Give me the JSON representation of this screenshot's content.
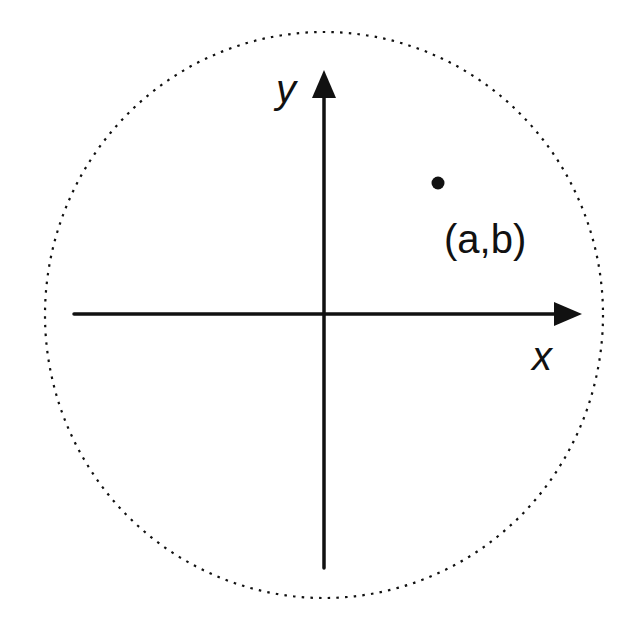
{
  "diagram": {
    "title": "",
    "colors": {
      "background": "#ffffff",
      "ink": "#111111"
    },
    "circle": {
      "cx": 324,
      "cy": 315,
      "rx": 279,
      "ry": 283,
      "style": "dotted"
    },
    "axes": {
      "x": {
        "label": "x",
        "x1": 74,
        "x2": 582,
        "y": 314
      },
      "y": {
        "label": "y",
        "y1": 568,
        "y2": 70,
        "x": 324
      }
    },
    "point": {
      "label": "(a,b)",
      "cx": 438,
      "cy": 183,
      "r": 6
    }
  }
}
